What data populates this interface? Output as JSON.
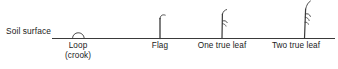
{
  "diagram": {
    "soil_surface_label": "Soil surface",
    "line_color": "#3a3a3a",
    "text_color": "#1a1a1a",
    "background_color": "#ffffff",
    "soil_line": {
      "x_start": 52,
      "x_end": 335,
      "y": 38
    },
    "stages": [
      {
        "id": "loop",
        "label": "Loop",
        "sublabel": "(crook)",
        "icon": "crook-arch-icon",
        "x": 78,
        "height": 7
      },
      {
        "id": "flag",
        "label": "Flag",
        "sublabel": "",
        "icon": "flag-seedling-icon",
        "x": 160,
        "height": 22
      },
      {
        "id": "one-true-leaf",
        "label": "One true leaf",
        "sublabel": "",
        "icon": "one-leaf-seedling-icon",
        "x": 222,
        "height": 27
      },
      {
        "id": "two-true-leaf",
        "label": "Two true leaf",
        "sublabel": "",
        "icon": "two-leaf-seedling-icon",
        "x": 305,
        "height": 38
      }
    ]
  }
}
